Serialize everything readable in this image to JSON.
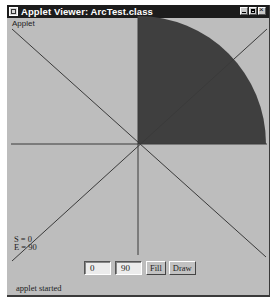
{
  "window": {
    "title": "Applet Viewer: ArcTest.class",
    "menu_label": "Applet",
    "controls": [
      "minimize",
      "maximize",
      "close"
    ]
  },
  "canvas": {
    "arc": {
      "start_angle": 0,
      "end_angle": 90,
      "mode": "fill",
      "fill_color": "#3f3f3f"
    },
    "background_color": "#bdbdbd",
    "line_color": "#3a3a3a",
    "info_lines": [
      "S = 0",
      "E = 90"
    ]
  },
  "controls": {
    "start_value": "0",
    "end_value": "90",
    "fill_label": "Fill",
    "draw_label": "Draw"
  },
  "status": {
    "text": "applet started"
  }
}
